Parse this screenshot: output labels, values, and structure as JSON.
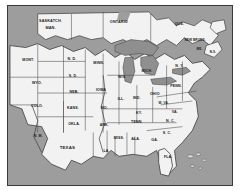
{
  "figure": {
    "kind": "political-map",
    "region": "Central and eastern United States with southern Canada",
    "frame_color": "#3a3a3a",
    "water_color": "#9d9d9d",
    "land_color": "#f2f2f2",
    "border_color": "#3c3c3c",
    "label_color": "#1b1b1b"
  },
  "labels": [
    {
      "id": "saskatchewan",
      "text": "SASKATCH.",
      "x": 19.0,
      "y": 9.0,
      "cls": "prov two"
    },
    {
      "id": "manitoba",
      "text": "MAN.",
      "x": 19.0,
      "y": 13.0,
      "cls": "prov two"
    },
    {
      "id": "ontario",
      "text": "ONTARIO",
      "x": 49.5,
      "y": 9.0,
      "cls": "prov"
    },
    {
      "id": "quebec",
      "text": "QUE.",
      "x": 76.5,
      "y": 10.0,
      "cls": "prov"
    },
    {
      "id": "new-brunswick",
      "text": "NEW BRUNS.",
      "x": 83.5,
      "y": 19.5,
      "cls": "tiny two"
    },
    {
      "id": "nova-scotia",
      "text": "N.S.",
      "x": 91.5,
      "y": 26.5,
      "cls": "tiny"
    },
    {
      "id": "maine",
      "text": "ME.",
      "x": 85.5,
      "y": 24.5,
      "cls": "tiny"
    },
    {
      "id": "montana",
      "text": "MONT.",
      "x": 9.0,
      "y": 30.5,
      "cls": ""
    },
    {
      "id": "north-dakota",
      "text": "N. D.",
      "x": 28.5,
      "y": 30.0,
      "cls": ""
    },
    {
      "id": "minnesota",
      "text": "MINN.",
      "x": 40.5,
      "y": 32.5,
      "cls": ""
    },
    {
      "id": "wisconsin",
      "text": "WIS.",
      "x": 51.0,
      "y": 40.5,
      "cls": ""
    },
    {
      "id": "michigan",
      "text": "MICH.",
      "x": 62.0,
      "y": 37.0,
      "cls": ""
    },
    {
      "id": "new-york",
      "text": "N. Y.",
      "x": 76.5,
      "y": 34.0,
      "cls": ""
    },
    {
      "id": "wyoming",
      "text": "WYO.",
      "x": 13.0,
      "y": 43.5,
      "cls": ""
    },
    {
      "id": "south-dakota",
      "text": "S. D.",
      "x": 29.0,
      "y": 39.5,
      "cls": ""
    },
    {
      "id": "iowa",
      "text": "IOWA",
      "x": 41.5,
      "y": 47.5,
      "cls": ""
    },
    {
      "id": "illinois",
      "text": "ILL.",
      "x": 50.5,
      "y": 52.5,
      "cls": ""
    },
    {
      "id": "indiana",
      "text": "IND.",
      "x": 57.5,
      "y": 52.0,
      "cls": ""
    },
    {
      "id": "ohio",
      "text": "OHIO",
      "x": 65.5,
      "y": 49.5,
      "cls": ""
    },
    {
      "id": "pennsylvania",
      "text": "PENN.",
      "x": 75.0,
      "y": 45.0,
      "cls": ""
    },
    {
      "id": "nebraska",
      "text": "NEB.",
      "x": 29.5,
      "y": 48.5,
      "cls": ""
    },
    {
      "id": "colorado",
      "text": "COLO.",
      "x": 13.0,
      "y": 56.5,
      "cls": ""
    },
    {
      "id": "kansas",
      "text": "KANS.",
      "x": 29.0,
      "y": 57.5,
      "cls": ""
    },
    {
      "id": "missouri",
      "text": "MO.",
      "x": 43.0,
      "y": 57.5,
      "cls": ""
    },
    {
      "id": "kentucky",
      "text": "KY.",
      "x": 58.5,
      "y": 60.5,
      "cls": ""
    },
    {
      "id": "west-virginia",
      "text": "W. VA.",
      "x": 69.5,
      "y": 55.0,
      "cls": "tiny"
    },
    {
      "id": "virginia",
      "text": "VA.",
      "x": 74.5,
      "y": 59.5,
      "cls": ""
    },
    {
      "id": "new-mexico",
      "text": "N. M.",
      "x": 13.5,
      "y": 73.0,
      "cls": ""
    },
    {
      "id": "oklahoma",
      "text": "OKLA.",
      "x": 29.5,
      "y": 66.5,
      "cls": ""
    },
    {
      "id": "arkansas",
      "text": "ARK.",
      "x": 43.0,
      "y": 67.0,
      "cls": ""
    },
    {
      "id": "tennessee",
      "text": "TENN.",
      "x": 57.5,
      "y": 65.5,
      "cls": ""
    },
    {
      "id": "north-carolina",
      "text": "N. C.",
      "x": 72.5,
      "y": 65.0,
      "cls": ""
    },
    {
      "id": "south-carolina",
      "text": "S. C.",
      "x": 71.0,
      "y": 71.5,
      "cls": ""
    },
    {
      "id": "georgia",
      "text": "GA.",
      "x": 65.5,
      "y": 75.5,
      "cls": ""
    },
    {
      "id": "alabama",
      "text": "ALA.",
      "x": 57.0,
      "y": 75.0,
      "cls": ""
    },
    {
      "id": "mississippi",
      "text": "MISS.",
      "x": 49.5,
      "y": 74.5,
      "cls": ""
    },
    {
      "id": "louisiana",
      "text": "LA.",
      "x": 44.0,
      "y": 81.5,
      "cls": ""
    },
    {
      "id": "texas",
      "text": "TEXAS",
      "x": 26.5,
      "y": 79.5,
      "cls": "big"
    },
    {
      "id": "florida",
      "text": "FLA.",
      "x": 71.5,
      "y": 85.0,
      "cls": ""
    }
  ]
}
